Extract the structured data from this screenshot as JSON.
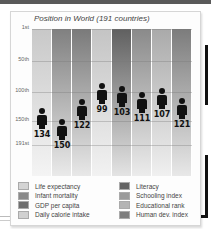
{
  "chart_data": {
    "type": "bar",
    "title": "Position in World (191 countries)",
    "xlabel": "",
    "ylabel": "Rank",
    "ylim": [
      1,
      191
    ],
    "y_inverted": true,
    "y_ticks": [
      "1st",
      "50th",
      "100th",
      "150th",
      "191st"
    ],
    "grid": true,
    "categories": [
      "Life expectancy",
      "Infant mortality",
      "GDP per capita",
      "Daily calorie intake",
      "Literacy",
      "Schooling index",
      "Educational rank",
      "Human dev. index"
    ],
    "values": [
      134,
      150,
      122,
      99,
      103,
      111,
      107,
      121
    ],
    "legend_position": "bottom"
  },
  "chart": {
    "title": "Position in World (191 countries)",
    "ticks": [
      {
        "label": "1st",
        "y": 0
      },
      {
        "label": "50th",
        "y": 32
      },
      {
        "label": "100th",
        "y": 63
      },
      {
        "label": "150th",
        "y": 92
      },
      {
        "label": "191st",
        "y": 116
      }
    ],
    "columns": [
      {
        "label": "Life expectancy",
        "value": "134",
        "top": "#c8c8c8",
        "bottom": "#f4f4f4",
        "fig_y": 100
      },
      {
        "label": "Infant mortality",
        "value": "150",
        "top": "#808080",
        "bottom": "#eaeaea",
        "fig_y": 111
      },
      {
        "label": "GDP per capita",
        "value": "122",
        "top": "#7a7a7a",
        "bottom": "#e8e8e8",
        "fig_y": 91
      },
      {
        "label": "Daily calorie intake",
        "value": "99",
        "top": "#c4c4c4",
        "bottom": "#f2f2f2",
        "fig_y": 75
      },
      {
        "label": "Literacy",
        "value": "103",
        "top": "#606060",
        "bottom": "#e4e4e4",
        "fig_y": 78
      },
      {
        "label": "Schooling index",
        "value": "111",
        "top": "#8a8a8a",
        "bottom": "#ececec",
        "fig_y": 84
      },
      {
        "label": "Educational rank",
        "value": "107",
        "top": "#aaaaaa",
        "bottom": "#f0f0f0",
        "fig_y": 80
      },
      {
        "label": "Human dev. index",
        "value": "121",
        "top": "#7c7c7c",
        "bottom": "#e8e8e8",
        "fig_y": 90
      }
    ]
  },
  "legend": {
    "left": [
      {
        "label": "Life expectancy",
        "color": "#d4d4d4"
      },
      {
        "label": "Infant mortality",
        "color": "#8a8a8a"
      },
      {
        "label": "GDP per capita",
        "color": "#6e6e6e"
      },
      {
        "label": "Daily calorie intake",
        "color": "#d0d0d0"
      }
    ],
    "right": [
      {
        "label": "Literacy",
        "color": "#646464"
      },
      {
        "label": "Schooling index",
        "color": "#9a9a9a"
      },
      {
        "label": "Educational rank",
        "color": "#b4b4b4"
      },
      {
        "label": "Human dev. index",
        "color": "#7e7e7e"
      }
    ]
  }
}
